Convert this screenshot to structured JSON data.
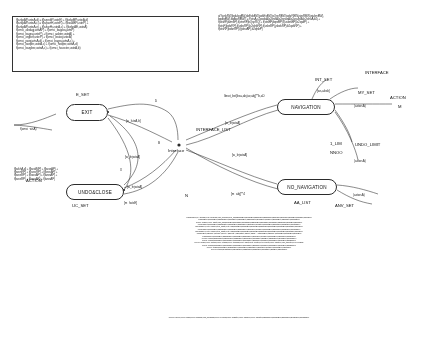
{
  "diagram": {
    "title_block": {
      "lines": [
        "f(bzkpAP,usteA,d) = f(bzprdtP,usteE) + f(bzkpBP,usteA,d)",
        "f(bzkpAP,usteA,c) = f(bzpwtH,usteR) + f(bzakBP,usteP) +",
        "f(bzkpAP,usteA,e) + f(bzkpH,usteA,c) + f(bzkpAE,usteA)",
        "f(omci_abdagj,wtsAP) + f(omci_bagaraj,wtsP)",
        "f(omci_bagraj,usteP) + f(omci_aabter,usteA) +",
        "f(omci_orgber,usteP) + f(omci_kwtarj,usteA)",
        "f(omci_pwqj,wtsA,d) + f(omci_bagraj,wtsA,c) +",
        "f(omci_bwqter,usteA,c) + f(omci_hwqter,usteA,d)",
        "f(omci_bargber,usteA,c) + f(omci_hawcter,usteA,b)"
      ]
    },
    "right_block": {
      "lines": [
        "at*/wnkRW,jbdukrqBW,jsbEdsBW,jsdsEsBW,jsQsnRBW,jsdsrRBW,jsjsrRBW,jsjukmBW),",
        "bqdfgBW),bqAwRBW)} = f*wtsA,c2podsA,b2oneA,b2epwsA,b2asubsA,b2whoA,b2j +",
        "f(wtsnP,jbzmbP),f(wtsmP,jbQspRQ) + f(wtsBP,jbqsrBP),f(usbrsBP),b2qsdP) +",
        "f(wtsP,jbdsrRP),f(usbsRP),b2whbRP),f(usbsRP),jsbdsRP),b2qdsRP) +",
        "f(wtsRP,jbdsnRP),f(jsbsrAP),b2qfsbP)"
      ]
    },
    "nodes": [
      {
        "id": "exit",
        "label": "EXIT",
        "x": 66,
        "y": 104,
        "w": 42,
        "h": 17
      },
      {
        "id": "navigation",
        "label": "NAVIGATION",
        "x": 277,
        "y": 99,
        "w": 58,
        "h": 16
      },
      {
        "id": "undoclose",
        "label": "UNDO&CLOSE",
        "x": 66,
        "y": 184,
        "w": 58,
        "h": 16
      },
      {
        "id": "no_navigation",
        "label": "NO_NAVIGATION",
        "x": 277,
        "y": 179,
        "w": 60,
        "h": 16
      }
    ],
    "interface_hub": {
      "label": "Interface",
      "x": 176,
      "y": 142
    },
    "side_labels": [
      {
        "id": "action-left",
        "text": "ACTION",
        "x": 26,
        "y": 178
      },
      {
        "id": "action-right",
        "text": "ACTION",
        "x": 390,
        "y": 95
      },
      {
        "id": "interface-right",
        "text": "INTERFACE",
        "x": 365,
        "y": 70
      },
      {
        "id": "interface-list",
        "text": "INTERFACE_LIST",
        "x": 196,
        "y": 127
      },
      {
        "id": "undo-limit",
        "text": "UNDO_LIMIT",
        "x": 355,
        "y": 142
      },
      {
        "id": "aa-list",
        "text": "AA_LIST",
        "x": 294,
        "y": 200
      },
      {
        "id": "e-set",
        "text": "E_SET",
        "x": 76,
        "y": 92
      },
      {
        "id": "uc-set",
        "text": "UC_SET",
        "x": 72,
        "y": 203
      },
      {
        "id": "int-set",
        "text": "INT_SET",
        "x": 315,
        "y": 77
      },
      {
        "id": "my-set",
        "text": "MY_SET",
        "x": 358,
        "y": 90
      },
      {
        "id": "1-lim",
        "text": "1_LIM",
        "x": 330,
        "y": 141
      },
      {
        "id": "nnoo",
        "text": "NNOO",
        "x": 330,
        "y": 150
      },
      {
        "id": "anv-set",
        "text": "ANV_SET",
        "x": 335,
        "y": 203
      },
      {
        "id": "m-right",
        "text": "M",
        "x": 398,
        "y": 104
      },
      {
        "id": "n-label",
        "text": "N",
        "x": 185,
        "y": 193
      }
    ],
    "edge_labels": [
      {
        "id": "edge-1",
        "text": "f(omci_wsA)",
        "x": 20,
        "y": 127
      },
      {
        "id": "edge-2",
        "text": "[w_lsteA,b]",
        "x": 126,
        "y": 119
      },
      {
        "id": "edge-3",
        "text": "D",
        "x": 155,
        "y": 99
      },
      {
        "id": "edge-4",
        "text": "[w_lnjwtsA]",
        "x": 125,
        "y": 155
      },
      {
        "id": "edge-5",
        "text": "[w_lnjwtsA]",
        "x": 127,
        "y": 185
      },
      {
        "id": "edge-6",
        "text": "[m_lwtsE]",
        "x": 124,
        "y": 201
      },
      {
        "id": "edge-7",
        "text": "[w_lejwtsA]",
        "x": 225,
        "y": 121
      },
      {
        "id": "edge-8",
        "text": "[w_lejwtsA]",
        "x": 232,
        "y": 153
      },
      {
        "id": "edge-9",
        "text": "[m_abj]**4",
        "x": 231,
        "y": 192
      },
      {
        "id": "edge-10",
        "text": "[ws,absb]",
        "x": 317,
        "y": 89
      },
      {
        "id": "edge-11",
        "text": "(astwsA)",
        "x": 354,
        "y": 104
      },
      {
        "id": "edge-12",
        "text": "(astwsA)",
        "x": 354,
        "y": 159
      },
      {
        "id": "edge-13",
        "text": "(astwsA)",
        "x": 353,
        "y": 193
      },
      {
        "id": "edge-14",
        "text": "lbnot_bst[bsa,abj,tw,abj]**b,aD",
        "x": 224,
        "y": 94
      },
      {
        "id": "edge-15",
        "text": "X",
        "x": 120,
        "y": 168
      },
      {
        "id": "edge-16",
        "text": "B",
        "x": 158,
        "y": 141
      }
    ],
    "left_equations": {
      "lines": [
        "f(bzkhA,d) + f(bzxkMP) + f(bzxsAP) +",
        "f(bzxnRP) + f(bzxsRP) + f(bzxsAP) +",
        "f(bzxsRP) + f(bzxsAP) + f(bzxsAP) +",
        "f(bzxsRP) + f(bzxsAP) + f(bzxsAP)"
      ]
    },
    "bottom_block": {
      "lines": [
        "f*(bzkmBW),bz_abcjagj,omci_kwapagj,omci_kwpagj,omci_aalj,jsbEdRBW,jsbdsRBW,jsbEdRBW,jsbEdRBW,jsbRpBW,jsubwBW,jsubsBW,jsdsRBW,jsjukrBW)",
        "f*(bzkrsBW),jbdsnRBW),f(jsbdsRBW),f(jsbdsBW),f(jsbsRBW),jsbsdRBW),jsbdRBW),jsdqBW),jsbsdRBW),jsbqRBW),jsbqsRBW)",
        "f(omci_nwsrR),omci_aajwt,omci_aalj,jsbdRBW,jsbsdRBW,jsbdsRBW,jsbEdRBW,jsbsdRBW,jsbqsRBW,jsbdsRBW,jsjukrBW,jsjsrRBW)",
        "f*(bzkdsBW),jbdsnRBW),f(jsbdsRBW),f(jsbsRBW),jsbsdRBW),jsbdRBW),jsdqBW),jsbsdRBW),jsbqRBW),jsbqsRBW),jsbqsRBW)",
        "f(bzdsRBW),omci_nwsrR,omci_aajwt,omci_aalj,jsbdRBW,jsbsdRBW,jsbdsRBW,jsbEdRBW,jsbsdRBW,jsbqsRBW,jsbdsRBW,jsjukrBW)",
        "f*(bzkdsBW),jbdsnRBW),f(jsbdsRBW),f(jsbsRBW),jsbsdRBW),jsbdRBW),jsdqBW),jsbsdRBW),jsbqRBW),jsbqsRBW),jsbqsRBW)",
        "f(bzdsRBW),omci_nwsrR,omci_aajwt,omci_aalj,jsbdRBW,jsbsdRBW,jsbdsRBW,jsbEdRBW,jsbsdRBW,jsbqsRBW,jsbdsRBW,jsjukrBW)",
        "f*(bzkmBW),b2ondsA,b2qwsA,b2oneA,b2mwsA,b2q,b2jdsA,b2wsA,b2qsA + f(bzkdsBW),b2qndsA,jsbdsRBW,jsbqsRBW,jsbdRBW)",
        "f*(bzdsRBW),jbdsnRBW),f(jsbdsRBW),f(jsbsRBW),jsbsdRBW),jsbdRBW),jsdqBW),jsbqsRBW),jsbqRBW),jsbqsRBW)",
        "f*(omci_bwsrR,jbdsnRBW),f(jsbdsRBW),f(jsbsRBW),jsbsdRBW),jsbdRBW),jsdqBW),jsbqsRBW),jsbqRBW),jsbqsRBW)",
        "f(omci_nwsrR,jbdsnRBW),f(jsbdsRBW),f(jsbsRBW),jsbsdRBW),jsbdRBW),jsdqBW),jsbqsRBW),jsbqRBW),jsbqsRBW)",
        "f(omci_kwsrR,omci_bqdsrR,omci_kwpagj,omci_kwapagj,omci_aajwt,omci_hwqter,omci_kwqter,omci_bargber,omci_hawcter,omci_kwsbgj)",
        "f(omci_hwsrR,jbdsnRBW),f(jsbdsRBW),f(jsbsRBW),jsbsdRBW),jsbdRBW),jsdqBW),jsbqsRBW),jsbqRBW),jsbqsRBW)",
        "f(omci_bwsrR,jbdsnRBW),f(jsbdsRBW),f(jsbsRBW),jsbsdRBW),jsbdRBW),jsdqBW),jsbqsRBW),jsbqRBW)",
        "f*(omci_kwsrR,jbdsnRBW),f(jsbdsRBW),f(jsbsRBW),jsbsdRBW),jsbdRBW),jsdqBW),jsbqsRBW)"
      ]
    },
    "bottom_block2": {
      "lines": [
        "f(omci_bzceR),omci_kgardi,omci_hwbrgaj,omci_hwarpagj,omci_kmqpagj,omci_bwsbter),omci_bargber),omci_hawcter),bsbqRBW),jsbqsRBW),jsbqRBW),jsbqsRBW),jsbqsRBW)"
      ]
    }
  }
}
